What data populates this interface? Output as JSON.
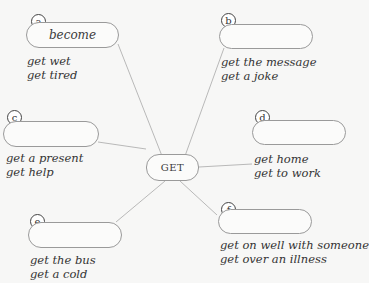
{
  "center": {
    "label": "GET"
  },
  "nodes": [
    {
      "id": "a",
      "word": "become",
      "examples": [
        "get wet",
        "get tired"
      ]
    },
    {
      "id": "b",
      "word": "",
      "examples": [
        "get the message",
        "get a joke"
      ]
    },
    {
      "id": "c",
      "word": "",
      "examples": [
        "get a present",
        "get help"
      ]
    },
    {
      "id": "d",
      "word": "",
      "examples": [
        "get home",
        "get to work"
      ]
    },
    {
      "id": "e",
      "word": "",
      "examples": [
        "get the bus",
        "get a cold"
      ]
    },
    {
      "id": "f",
      "word": "",
      "examples": [
        "get on well with someone",
        "get over an illness"
      ]
    }
  ]
}
